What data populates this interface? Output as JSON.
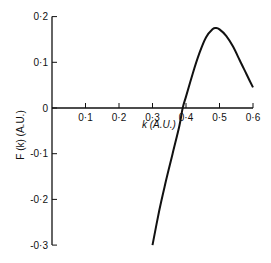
{
  "chart_data": {
    "type": "line",
    "title": "",
    "xlabel": "k (A.U.)",
    "ylabel": "F (k) (A.U.)",
    "xlim": [
      0,
      0.6
    ],
    "ylim": [
      -0.3,
      0.2
    ],
    "grid": false,
    "legend": null,
    "x_ticks": [
      "0·1",
      "0·2",
      "0·3",
      "0·4",
      "0·5",
      "0·6"
    ],
    "x_tick_values": [
      0.1,
      0.2,
      0.3,
      0.4,
      0.5,
      0.6
    ],
    "y_ticks": [
      "0·2",
      "0·1",
      "0",
      "-0·1",
      "-0·2",
      "-0·3"
    ],
    "y_tick_values": [
      0.2,
      0.1,
      0,
      -0.1,
      -0.2,
      -0.3
    ],
    "series": [
      {
        "name": "F(k)",
        "x": [
          0.3,
          0.32,
          0.34,
          0.36,
          0.38,
          0.39,
          0.4,
          0.42,
          0.44,
          0.46,
          0.48,
          0.49,
          0.5,
          0.52,
          0.54,
          0.56,
          0.58,
          0.6
        ],
        "y": [
          -0.3,
          -0.225,
          -0.16,
          -0.1,
          -0.04,
          0.0,
          0.025,
          0.075,
          0.12,
          0.155,
          0.173,
          0.175,
          0.172,
          0.158,
          0.135,
          0.105,
          0.075,
          0.045
        ]
      }
    ]
  }
}
